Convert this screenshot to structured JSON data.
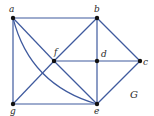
{
  "graph": {
    "name": "G",
    "edge_color": "#3f5a9e",
    "vertex_color": "#111111",
    "vertices": [
      {
        "id": "a",
        "label": "a",
        "x": 13,
        "y": 18
      },
      {
        "id": "b",
        "label": "b",
        "x": 97,
        "y": 18
      },
      {
        "id": "c",
        "label": "c",
        "x": 140,
        "y": 61
      },
      {
        "id": "d",
        "label": "d",
        "x": 97,
        "y": 61
      },
      {
        "id": "e",
        "label": "e",
        "x": 97,
        "y": 104
      },
      {
        "id": "f",
        "label": "f",
        "x": 54,
        "y": 61
      },
      {
        "id": "g",
        "label": "g",
        "x": 13,
        "y": 104
      }
    ],
    "edges": [
      [
        "a",
        "b"
      ],
      [
        "a",
        "g"
      ],
      [
        "a",
        "f"
      ],
      [
        "a",
        "e"
      ],
      [
        "b",
        "d"
      ],
      [
        "b",
        "c"
      ],
      [
        "b",
        "f"
      ],
      [
        "f",
        "d"
      ],
      [
        "f",
        "g"
      ],
      [
        "f",
        "e"
      ],
      [
        "d",
        "c"
      ],
      [
        "d",
        "e"
      ],
      [
        "c",
        "e"
      ],
      [
        "g",
        "e"
      ]
    ]
  }
}
